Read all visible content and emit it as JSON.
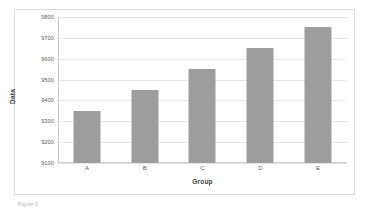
{
  "chart_data": {
    "type": "bar",
    "title": "",
    "subtitle": "",
    "categories": [
      "A",
      "B",
      "C",
      "D",
      "E"
    ],
    "values": [
      9350,
      9450,
      9550,
      9650,
      9750
    ],
    "series": [
      {
        "name": "Data",
        "values": [
          9350,
          9450,
          9550,
          9650,
          9750
        ]
      }
    ],
    "xlabel": "Group",
    "ylabel": "Data",
    "ylim": [
      9100,
      9800
    ],
    "ytick_labels": [
      "9800",
      "9700",
      "9600",
      "9500",
      "9400",
      "9300",
      "9200",
      "9100"
    ],
    "ytick_values": [
      9800,
      9700,
      9600,
      9500,
      9400,
      9300,
      9200,
      9100
    ],
    "ytick_step": 100,
    "grid": true,
    "grid_axis": "y",
    "legend": false,
    "legend_position": "none",
    "annotations": [],
    "colors": {
      "bar_fill": "#9d9d9d",
      "gridline": "#e6e6e6",
      "axis_line": "#c9c9c9",
      "frame_border": "#d9d9d9",
      "tick_label": "#5a5a5a",
      "axis_title": "#3d3d3d",
      "background": "#ffffff"
    }
  },
  "caption": {
    "text": "Figure 5"
  }
}
